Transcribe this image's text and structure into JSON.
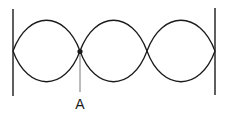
{
  "diagram": {
    "type": "standing-wave",
    "loops": 3,
    "ends": "fixed",
    "point_label": "A",
    "point_location": "first interior node",
    "colors": {
      "stroke": "#1a1a1a",
      "background": "#ffffff"
    }
  }
}
